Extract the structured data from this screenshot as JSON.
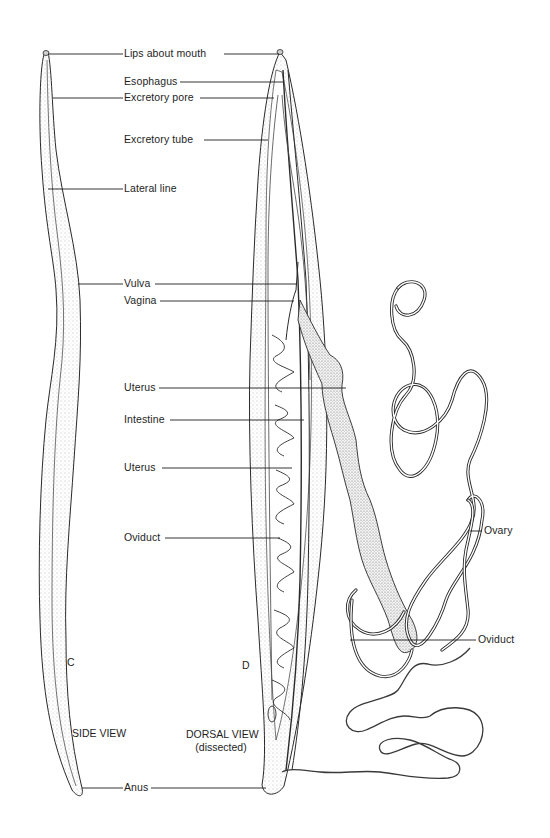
{
  "figure": {
    "panels": [
      {
        "id": "C",
        "letter": "C",
        "caption": "SIDE VIEW"
      },
      {
        "id": "D",
        "letter": "D",
        "caption_line1": "DORSAL VIEW",
        "caption_line2": "(dissected)"
      }
    ],
    "labels": {
      "lips_about_mouth": "Lips about mouth",
      "esophagus": "Esophagus",
      "excretory_pore": "Excretory pore",
      "excretory_tube": "Excretory tube",
      "lateral_line": "Lateral line",
      "vulva": "Vulva",
      "vagina": "Vagina",
      "uterus_1": "Uterus",
      "intestine": "Intestine",
      "uterus_2": "Uterus",
      "oviduct_left": "Oviduct",
      "ovary": "Ovary",
      "oviduct_right": "Oviduct",
      "anus": "Anus"
    },
    "colors": {
      "ink": "#1e1e1e",
      "stipple": "#8a8a8a",
      "background": "#ffffff"
    }
  }
}
